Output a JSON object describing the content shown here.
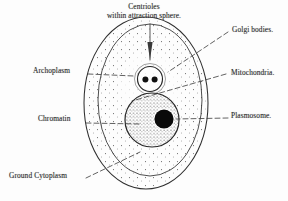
{
  "figure": {
    "background_color": "#fdfdfd",
    "ink_color": "#2b2b2b"
  },
  "labels": {
    "centrioles_line1": "Centrioles",
    "centrioles_line2": "within attraction sphere.",
    "golgi": "Golgi bodies.",
    "mitochondria": "Mitochondria.",
    "plasmosome": "Plasmosome.",
    "archoplasm": "Archoplasm",
    "chromatin": "Chromatin",
    "ground_cytoplasm": "Ground Cytoplasm"
  },
  "structures": {
    "cell_membrane": "outer-oval",
    "inner_boundary": "inner-oval",
    "attraction_sphere": "small-circle-upper",
    "centriole_count": 2,
    "nucleus": "large-stippled-circle",
    "plasmosome_body": "solid-black-disc"
  }
}
